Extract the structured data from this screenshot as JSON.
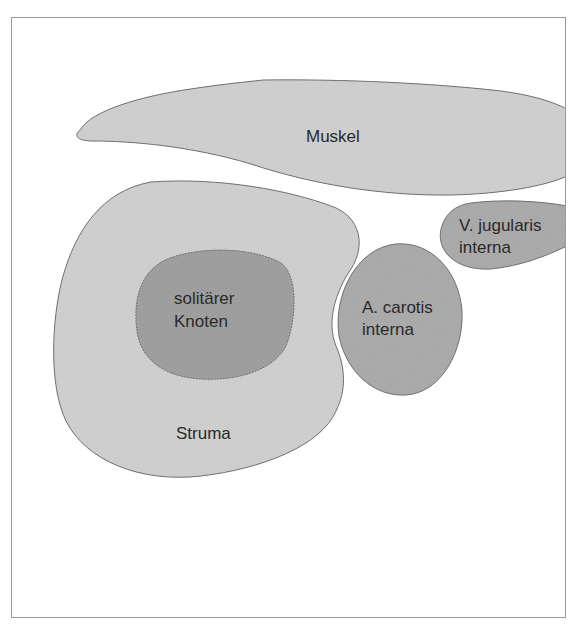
{
  "diagram": {
    "type": "anatomical-schematic",
    "colors": {
      "background": "#ffffff",
      "frame": "#9a9a9a",
      "light_fill": "#cdcdcd",
      "vessel_fill": "#a8a8a8",
      "nodule_fill": "#9c9c9c",
      "outline": "#6e6e6e",
      "text": "#2a2a2a"
    },
    "structures": {
      "muscle": {
        "label": "Muskel"
      },
      "struma": {
        "label": "Struma"
      },
      "nodule": {
        "line1": "solitärer",
        "line2": "Knoten"
      },
      "carotid": {
        "line1": "A. carotis",
        "line2": "interna"
      },
      "jugular": {
        "line1": "V. jugularis",
        "line2": "interna"
      }
    }
  }
}
